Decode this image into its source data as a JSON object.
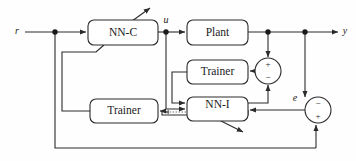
{
  "diagram": {
    "colors": {
      "line": "#2b2b2b",
      "dotted_line": "#6e6e6e",
      "box_fill": "#ffffff",
      "text": "#1a1a1a",
      "background": "#fefefe"
    },
    "blocks": [
      {
        "id": "nn-c",
        "label": "NN-C",
        "x": 88,
        "y": 20,
        "w": 70,
        "h": 25
      },
      {
        "id": "plant",
        "label": "Plant",
        "x": 187,
        "y": 20,
        "w": 61,
        "h": 25
      },
      {
        "id": "trainer-upper",
        "label": "Trainer",
        "x": 187,
        "y": 60,
        "w": 61,
        "h": 24
      },
      {
        "id": "nn-i",
        "label": "NN-I",
        "x": 187,
        "y": 97,
        "w": 61,
        "h": 24
      },
      {
        "id": "trainer-lower",
        "label": "Trainer",
        "x": 90,
        "y": 99,
        "w": 68,
        "h": 24
      }
    ],
    "summing_junctions": [
      {
        "id": "sum-upper",
        "cx": 268,
        "cy": 71,
        "r": 13,
        "top_sign": "+",
        "bottom_sign": "−"
      },
      {
        "id": "sum-lower",
        "cx": 318,
        "cy": 110,
        "r": 13,
        "top_sign": "−",
        "bottom_sign": "+"
      }
    ],
    "signals": [
      {
        "id": "r",
        "label": "r",
        "x": 17,
        "y": 32
      },
      {
        "id": "u",
        "label": "u",
        "x": 166,
        "y": 21
      },
      {
        "id": "y",
        "label": "y",
        "x": 345,
        "y": 32
      },
      {
        "id": "e",
        "label": "e",
        "x": 295,
        "y": 99
      }
    ],
    "junction_dots": [
      {
        "id": "dot-r-branch",
        "cx": 55,
        "cy": 32
      },
      {
        "id": "dot-u-branch",
        "cx": 166,
        "cy": 32
      },
      {
        "id": "dot-y-feedback1",
        "cx": 268,
        "cy": 32
      },
      {
        "id": "dot-y-feedback2",
        "cx": 305,
        "cy": 32
      }
    ],
    "adaptation_arrows": [
      {
        "id": "nn-c-learning-arrow",
        "from_x": 128,
        "from_y": 24,
        "to_x": 150,
        "to_y": 8
      },
      {
        "id": "nn-i-learning-arrow",
        "from_x": 215,
        "from_y": 118,
        "to_x": 243,
        "to_y": 132
      }
    ]
  }
}
